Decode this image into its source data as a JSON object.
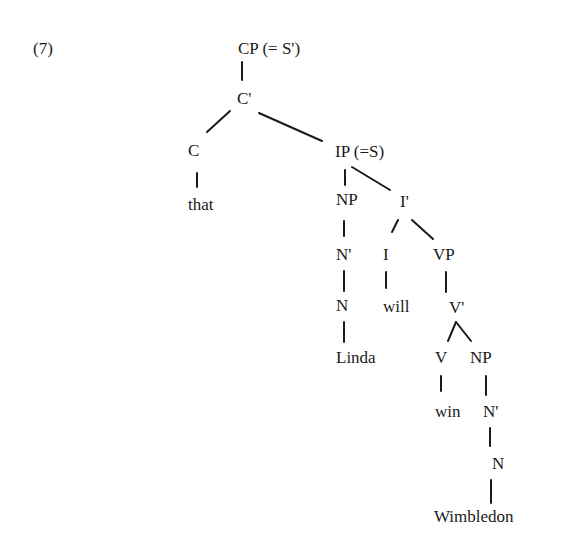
{
  "example_label": "(7)",
  "tree": {
    "nodes": {
      "cp": "CP (= S')",
      "c_bar": "C'",
      "c": "C",
      "that": "that",
      "ip": "IP (=S)",
      "np_subj": "NP",
      "n_bar_subj": "N'",
      "n_subj": "N",
      "linda": "Linda",
      "i_bar": "I'",
      "i": "I",
      "will": "will",
      "vp": "VP",
      "v_bar": "V'",
      "v": "V",
      "win": "win",
      "np_obj": "NP",
      "n_bar_obj": "N'",
      "n_obj": "N",
      "wimbledon": "Wimbledon"
    },
    "edges": [
      [
        "CP",
        "C'"
      ],
      [
        "C'",
        "C"
      ],
      [
        "C'",
        "IP"
      ],
      [
        "C",
        "that"
      ],
      [
        "IP",
        "NP"
      ],
      [
        "IP",
        "I'"
      ],
      [
        "NP",
        "N'"
      ],
      [
        "N'",
        "N"
      ],
      [
        "N",
        "Linda"
      ],
      [
        "I'",
        "I"
      ],
      [
        "I'",
        "VP"
      ],
      [
        "I",
        "will"
      ],
      [
        "VP",
        "V'"
      ],
      [
        "V'",
        "V"
      ],
      [
        "V'",
        "NP"
      ],
      [
        "V",
        "win"
      ],
      [
        "NP",
        "N'"
      ],
      [
        "N'",
        "N"
      ],
      [
        "N",
        "Wimbledon"
      ]
    ]
  }
}
